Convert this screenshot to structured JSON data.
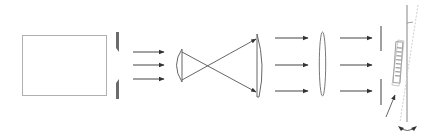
{
  "diagram": {
    "type": "optical-setup",
    "colors": {
      "background": "#ffffff",
      "line": "#555555",
      "light_line": "#9a9a9a",
      "slit_fill": "#6b6b6b",
      "faint_line": "#c8c8c8"
    },
    "components": [
      {
        "id": "light-source-box",
        "shape": "rectangle"
      },
      {
        "id": "entrance-slit",
        "shape": "two-jaw-slit"
      },
      {
        "id": "arrows-group-1",
        "count": 3
      },
      {
        "id": "lens-small",
        "shape": "plano-convex"
      },
      {
        "id": "crossing-rays",
        "count": 2
      },
      {
        "id": "lens-large",
        "shape": "plano-convex"
      },
      {
        "id": "arrows-group-2",
        "count": 3
      },
      {
        "id": "lens-thin",
        "shape": "biconvex"
      },
      {
        "id": "arrows-group-3",
        "count": 3
      },
      {
        "id": "aperture-slit",
        "shape": "two-bar-slit"
      },
      {
        "id": "grating",
        "shape": "tilted-ruled-element"
      },
      {
        "id": "rotation-indicator",
        "shape": "double-arrow"
      }
    ]
  }
}
